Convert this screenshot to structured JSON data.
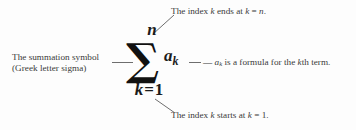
{
  "figure": {
    "background_color": "#fdfdfd",
    "text_color": "#3a3a3a",
    "math_color": "#1b1b1b",
    "leader_line_color": "#6e6e6e"
  },
  "expression": {
    "upper_limit": "n",
    "summation_symbol": "∑",
    "summand_base": "a",
    "summand_subscript": "k",
    "lower_limit_index": "k",
    "lower_limit_equals": "=",
    "lower_limit_value": "1"
  },
  "annotations": {
    "top": {
      "prefix": "The index ",
      "var1": "k",
      "middle": " ends at ",
      "var2": "k",
      "equals": " = ",
      "var3": "n",
      "period": "."
    },
    "left": {
      "line1": "The summation symbol",
      "line2": "(Greek letter sigma)"
    },
    "right": {
      "dash": "— ",
      "term_base": "a",
      "term_sub": "k",
      "text": " is a formula for the ",
      "var": "k",
      "suffix": "th term."
    },
    "bottom": {
      "prefix": "The index ",
      "var1": "k",
      "middle": " starts at ",
      "var2": "k",
      "equals": " = ",
      "value": "1",
      "period": "."
    }
  }
}
